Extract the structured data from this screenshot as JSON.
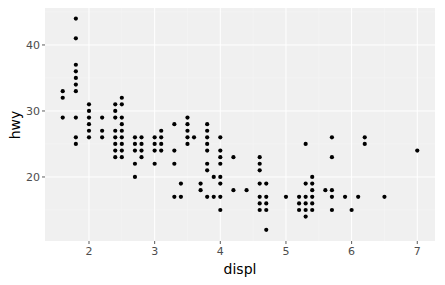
{
  "chart_data": {
    "type": "scatter",
    "title": "",
    "xlabel": "displ",
    "ylabel": "hwy",
    "xlim": [
      1.33,
      7.27
    ],
    "ylim": [
      10.3,
      45.6
    ],
    "x_ticks": [
      2,
      3,
      4,
      5,
      6,
      7
    ],
    "x_tick_labels": [
      "2",
      "3",
      "4",
      "5",
      "6",
      "7"
    ],
    "y_ticks": [
      20,
      30,
      40
    ],
    "y_tick_labels": [
      "20",
      "30",
      "40"
    ],
    "grid": true,
    "legend": null,
    "colors": {
      "panel": "#f0f0f0",
      "grid_major": "#ffffff",
      "grid_minor": "#f7f7f7",
      "point": "#000000",
      "tick": "#4d4d4d"
    },
    "points": [
      {
        "x": 1.6,
        "y": 33
      },
      {
        "x": 1.6,
        "y": 32
      },
      {
        "x": 1.6,
        "y": 29
      },
      {
        "x": 1.8,
        "y": 44
      },
      {
        "x": 1.8,
        "y": 41
      },
      {
        "x": 1.8,
        "y": 37
      },
      {
        "x": 1.8,
        "y": 36
      },
      {
        "x": 1.8,
        "y": 35
      },
      {
        "x": 1.8,
        "y": 34
      },
      {
        "x": 1.8,
        "y": 33
      },
      {
        "x": 1.8,
        "y": 29
      },
      {
        "x": 1.8,
        "y": 26
      },
      {
        "x": 1.8,
        "y": 25
      },
      {
        "x": 2.0,
        "y": 31
      },
      {
        "x": 2.0,
        "y": 30
      },
      {
        "x": 2.0,
        "y": 29
      },
      {
        "x": 2.0,
        "y": 28
      },
      {
        "x": 2.0,
        "y": 27
      },
      {
        "x": 2.0,
        "y": 26
      },
      {
        "x": 2.2,
        "y": 29
      },
      {
        "x": 2.2,
        "y": 27
      },
      {
        "x": 2.2,
        "y": 26
      },
      {
        "x": 2.4,
        "y": 31
      },
      {
        "x": 2.4,
        "y": 30
      },
      {
        "x": 2.4,
        "y": 29
      },
      {
        "x": 2.4,
        "y": 27
      },
      {
        "x": 2.4,
        "y": 26
      },
      {
        "x": 2.4,
        "y": 25
      },
      {
        "x": 2.4,
        "y": 24
      },
      {
        "x": 2.4,
        "y": 23
      },
      {
        "x": 2.5,
        "y": 32
      },
      {
        "x": 2.5,
        "y": 31
      },
      {
        "x": 2.5,
        "y": 29
      },
      {
        "x": 2.5,
        "y": 28
      },
      {
        "x": 2.5,
        "y": 27
      },
      {
        "x": 2.5,
        "y": 26
      },
      {
        "x": 2.5,
        "y": 25
      },
      {
        "x": 2.5,
        "y": 24
      },
      {
        "x": 2.5,
        "y": 23
      },
      {
        "x": 2.7,
        "y": 26
      },
      {
        "x": 2.7,
        "y": 25
      },
      {
        "x": 2.7,
        "y": 24
      },
      {
        "x": 2.7,
        "y": 22
      },
      {
        "x": 2.7,
        "y": 20
      },
      {
        "x": 2.8,
        "y": 26
      },
      {
        "x": 2.8,
        "y": 25
      },
      {
        "x": 2.8,
        "y": 24
      },
      {
        "x": 2.8,
        "y": 23
      },
      {
        "x": 3.0,
        "y": 26
      },
      {
        "x": 3.0,
        "y": 25
      },
      {
        "x": 3.0,
        "y": 24
      },
      {
        "x": 3.0,
        "y": 22
      },
      {
        "x": 3.1,
        "y": 27
      },
      {
        "x": 3.1,
        "y": 26
      },
      {
        "x": 3.1,
        "y": 25
      },
      {
        "x": 3.1,
        "y": 24
      },
      {
        "x": 3.3,
        "y": 28
      },
      {
        "x": 3.3,
        "y": 24
      },
      {
        "x": 3.3,
        "y": 22
      },
      {
        "x": 3.3,
        "y": 17
      },
      {
        "x": 3.4,
        "y": 19
      },
      {
        "x": 3.4,
        "y": 17
      },
      {
        "x": 3.5,
        "y": 29
      },
      {
        "x": 3.5,
        "y": 28
      },
      {
        "x": 3.5,
        "y": 27
      },
      {
        "x": 3.5,
        "y": 26
      },
      {
        "x": 3.5,
        "y": 25
      },
      {
        "x": 3.6,
        "y": 26
      },
      {
        "x": 3.7,
        "y": 19
      },
      {
        "x": 3.7,
        "y": 18
      },
      {
        "x": 3.8,
        "y": 28
      },
      {
        "x": 3.8,
        "y": 27
      },
      {
        "x": 3.8,
        "y": 26
      },
      {
        "x": 3.8,
        "y": 25
      },
      {
        "x": 3.8,
        "y": 24
      },
      {
        "x": 3.8,
        "y": 22
      },
      {
        "x": 3.8,
        "y": 21
      },
      {
        "x": 3.8,
        "y": 17
      },
      {
        "x": 3.9,
        "y": 20
      },
      {
        "x": 3.9,
        "y": 17
      },
      {
        "x": 4.0,
        "y": 26
      },
      {
        "x": 4.0,
        "y": 24
      },
      {
        "x": 4.0,
        "y": 23
      },
      {
        "x": 4.0,
        "y": 22
      },
      {
        "x": 4.0,
        "y": 20
      },
      {
        "x": 4.0,
        "y": 19
      },
      {
        "x": 4.0,
        "y": 17
      },
      {
        "x": 4.0,
        "y": 15
      },
      {
        "x": 4.2,
        "y": 23
      },
      {
        "x": 4.2,
        "y": 18
      },
      {
        "x": 4.4,
        "y": 18
      },
      {
        "x": 4.6,
        "y": 23
      },
      {
        "x": 4.6,
        "y": 22
      },
      {
        "x": 4.6,
        "y": 21
      },
      {
        "x": 4.6,
        "y": 19
      },
      {
        "x": 4.6,
        "y": 17
      },
      {
        "x": 4.6,
        "y": 16
      },
      {
        "x": 4.6,
        "y": 15
      },
      {
        "x": 4.7,
        "y": 19
      },
      {
        "x": 4.7,
        "y": 17
      },
      {
        "x": 4.7,
        "y": 16
      },
      {
        "x": 4.7,
        "y": 15
      },
      {
        "x": 4.7,
        "y": 12
      },
      {
        "x": 5.0,
        "y": 17
      },
      {
        "x": 5.2,
        "y": 17
      },
      {
        "x": 5.2,
        "y": 16
      },
      {
        "x": 5.2,
        "y": 15
      },
      {
        "x": 5.3,
        "y": 25
      },
      {
        "x": 5.3,
        "y": 19
      },
      {
        "x": 5.3,
        "y": 17
      },
      {
        "x": 5.3,
        "y": 16
      },
      {
        "x": 5.3,
        "y": 15
      },
      {
        "x": 5.3,
        "y": 14
      },
      {
        "x": 5.4,
        "y": 20
      },
      {
        "x": 5.4,
        "y": 19
      },
      {
        "x": 5.4,
        "y": 18
      },
      {
        "x": 5.4,
        "y": 17
      },
      {
        "x": 5.4,
        "y": 16
      },
      {
        "x": 5.4,
        "y": 15
      },
      {
        "x": 5.6,
        "y": 18
      },
      {
        "x": 5.7,
        "y": 26
      },
      {
        "x": 5.7,
        "y": 23
      },
      {
        "x": 5.7,
        "y": 18
      },
      {
        "x": 5.7,
        "y": 17
      },
      {
        "x": 5.7,
        "y": 15
      },
      {
        "x": 5.9,
        "y": 17
      },
      {
        "x": 6.0,
        "y": 15
      },
      {
        "x": 6.1,
        "y": 17
      },
      {
        "x": 6.2,
        "y": 26
      },
      {
        "x": 6.2,
        "y": 25
      },
      {
        "x": 6.5,
        "y": 17
      },
      {
        "x": 7.0,
        "y": 24
      }
    ]
  }
}
